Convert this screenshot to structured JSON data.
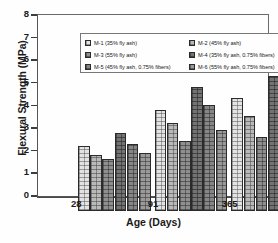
{
  "chart_data": {
    "type": "bar",
    "title": "",
    "xlabel": "Age (Days)",
    "ylabel": "Flexural Strength (MPa)",
    "categories": [
      "28",
      "91",
      "365"
    ],
    "ylim": [
      0,
      8
    ],
    "yticks": [
      "0",
      "1",
      "2",
      "3",
      "4",
      "5",
      "6",
      "7",
      "8"
    ],
    "grid": false,
    "legend_position": "top-inside-box",
    "series": [
      {
        "name": "M-1 (35% fly ash)",
        "values": [
          2.88,
          4.48,
          4.98
        ]
      },
      {
        "name": "M-2 (45% fly ash)",
        "values": [
          2.48,
          3.88,
          4.18
        ]
      },
      {
        "name": "M-3 (55% fly ash)",
        "values": [
          2.28,
          3.08,
          3.27
        ]
      },
      {
        "name": "M-4 (35% fly ash, 0.75% fibers)",
        "values": [
          3.47,
          5.48,
          5.97
        ]
      },
      {
        "name": "M-5 (45% fly ash, 0.75% fibers)",
        "values": [
          2.98,
          4.68,
          5.48
        ]
      },
      {
        "name": "M-6 (55% fly ash, 0.75% fibers)",
        "values": [
          2.58,
          3.57,
          4.47
        ]
      }
    ]
  },
  "legend": {
    "entries": [
      {
        "label": "M-1 (35% fly ash)"
      },
      {
        "label": "M-2 (45% fly ash)"
      },
      {
        "label": "M-3 (55% fly ash)"
      },
      {
        "label": "M-4 (35% fly ash, 0.75% fibers)"
      },
      {
        "label": "M-5 (45% fly ash, 0.75% fibers)"
      },
      {
        "label": "M-6 (55% fly ash, 0.75% fibers)"
      }
    ]
  }
}
